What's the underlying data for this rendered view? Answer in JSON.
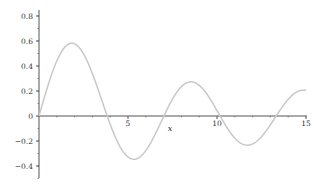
{
  "chart_data": {
    "type": "line",
    "title": "",
    "xlabel": "x",
    "ylabel": "",
    "xlim": [
      0,
      15
    ],
    "ylim": [
      -0.5,
      0.85
    ],
    "grid": false,
    "legend": null,
    "x_ticks": [
      5,
      10,
      15
    ],
    "x_tick_labels": [
      "5",
      "10",
      "15"
    ],
    "y_ticks": [
      0.8,
      0.6,
      0.4,
      0.2,
      0,
      -0.2,
      -0.4
    ],
    "y_tick_labels": [
      "0.8",
      "0.6",
      "0.4",
      "0.2",
      "0",
      "-0.2",
      "-0.4"
    ],
    "series": [
      {
        "name": "J1(x)",
        "color": "#c8c8c8",
        "x": [
          0,
          0.5,
          1,
          1.5,
          1.84,
          2.5,
          3,
          3.83,
          4.5,
          5.33,
          6,
          7.02,
          7.5,
          8.54,
          9.5,
          10.17,
          11,
          11.71,
          12.5,
          13.32,
          14,
          15
        ],
        "values": [
          0,
          0.242,
          0.44,
          0.558,
          0.582,
          0.497,
          0.339,
          0,
          -0.231,
          -0.346,
          -0.277,
          0,
          0.135,
          0.273,
          0.161,
          0,
          -0.177,
          -0.25,
          -0.164,
          0,
          0.133,
          0.205
        ]
      }
    ]
  },
  "colors": {
    "axis": "#555555",
    "curve": "#c8c8c8",
    "background": "#ffffff"
  }
}
